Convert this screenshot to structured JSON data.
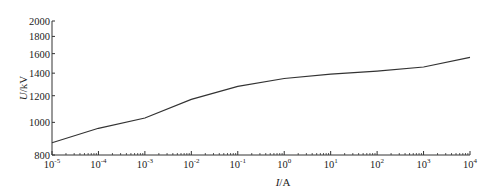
{
  "chart_data": {
    "type": "line",
    "title": "",
    "xlabel": "I/A",
    "ylabel": "U/kV",
    "xscale": "log",
    "yscale": "log",
    "xlim": [
      1e-05,
      10000.0
    ],
    "ylim": [
      800,
      2000
    ],
    "grid": false,
    "legend": null,
    "x_tick_labels": [
      "10^-5",
      "10^-4",
      "10^-3",
      "10^-2",
      "10^-1",
      "10^0",
      "10^1",
      "10^2",
      "10^3",
      "10^4"
    ],
    "y_tick_labels": [
      "800",
      "1000",
      "1200",
      "1400",
      "1600",
      "1800",
      "2000"
    ],
    "series": [
      {
        "name": "U-I characteristic",
        "x": [
          1e-05,
          0.0001,
          0.001,
          0.01,
          0.1,
          1.0,
          10.0,
          100.0,
          1000.0,
          10000.0
        ],
        "values": [
          870,
          960,
          1030,
          1170,
          1280,
          1350,
          1390,
          1420,
          1460,
          1560
        ]
      }
    ]
  },
  "axes": {
    "x_label_italic": "I",
    "x_label_unit": "/A",
    "y_label_italic": "U",
    "y_label_unit": "/kV",
    "x_ticks": [
      {
        "base": "10",
        "exp": "-5"
      },
      {
        "base": "10",
        "exp": "-4"
      },
      {
        "base": "10",
        "exp": "-3"
      },
      {
        "base": "10",
        "exp": "-2"
      },
      {
        "base": "10",
        "exp": "-1"
      },
      {
        "base": "10",
        "exp": "0"
      },
      {
        "base": "10",
        "exp": "1"
      },
      {
        "base": "10",
        "exp": "2"
      },
      {
        "base": "10",
        "exp": "3"
      },
      {
        "base": "10",
        "exp": "4"
      }
    ],
    "y_ticks": [
      "800",
      "1000",
      "1200",
      "1400",
      "1600",
      "1800",
      "2000"
    ]
  }
}
